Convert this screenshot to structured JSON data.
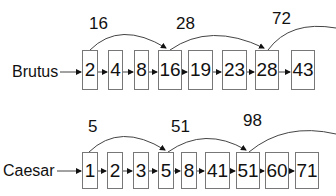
{
  "lists": [
    {
      "term": "Brutus",
      "postings": [
        "2",
        "4",
        "8",
        "16",
        "19",
        "23",
        "28",
        "43"
      ],
      "skips": [
        {
          "label": "16",
          "from": "2",
          "to": "16"
        },
        {
          "label": "28",
          "from": "16",
          "to": "28"
        },
        {
          "label": "72",
          "from": "28",
          "to": "72"
        }
      ]
    },
    {
      "term": "Caesar",
      "postings": [
        "1",
        "2",
        "3",
        "5",
        "8",
        "41",
        "51",
        "60",
        "71"
      ],
      "skips": [
        {
          "label": "5",
          "from": "1",
          "to": "5"
        },
        {
          "label": "51",
          "from": "5",
          "to": "51"
        },
        {
          "label": "98",
          "from": "51",
          "to": "98"
        }
      ]
    }
  ]
}
